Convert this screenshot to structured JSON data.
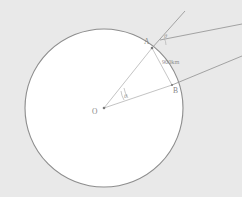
{
  "diagram": {
    "background_color": "#e9e9e9",
    "circle_fill": "#ffffff",
    "circle_stroke": "#8d8d8d",
    "line_color": "#9a9a9a",
    "label_color": "#8a8a8a",
    "points": {
      "center_label": "O",
      "upper_label": "A",
      "lower_label": "B"
    },
    "measurements": {
      "segment_ab": "900km"
    },
    "angles": {
      "at_center": "θ",
      "at_a": "θ"
    }
  }
}
